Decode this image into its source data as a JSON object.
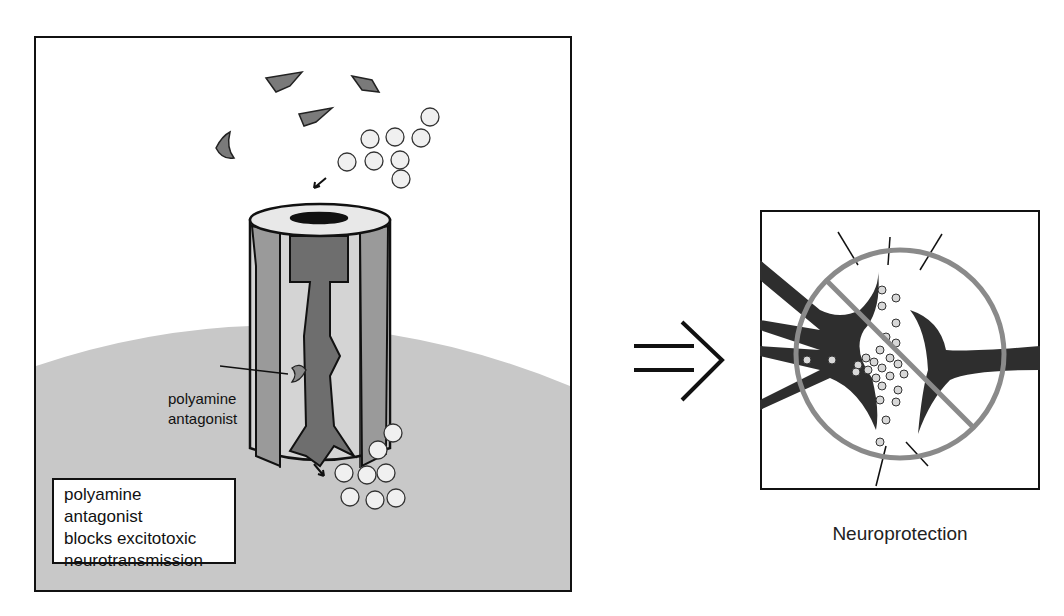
{
  "left_panel": {
    "callout_label": [
      "polyamine",
      "antagonist"
    ],
    "box_text": [
      "polyamine antagonist",
      "blocks excitotoxic",
      "neurotransmission"
    ],
    "colors": {
      "membrane": "#c8c8c8",
      "channel_light": "#d4d4d4",
      "channel_mid": "#9a9a9a",
      "channel_dark": "#6e6e6e",
      "ligand": "#808080",
      "vesicle": "#f0f0f0"
    }
  },
  "arrow": {
    "icon": "implies-arrow-icon"
  },
  "right_panel": {
    "caption": "Neuroprotection",
    "colors": {
      "neuron": "#2e2e2e",
      "prohibition_sign": "#8a8a8a",
      "vesicle": "#d8d8d8"
    }
  }
}
